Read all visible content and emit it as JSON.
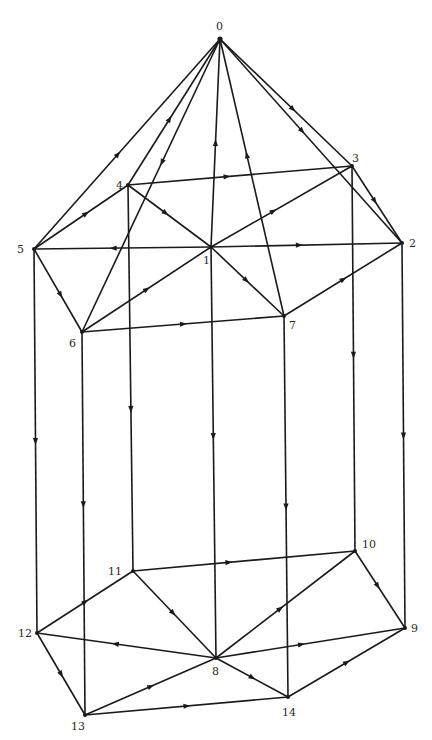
{
  "diagram": {
    "title": "",
    "type": "directed-graph",
    "vertices": [
      {
        "id": "0",
        "x": 220,
        "y": 39,
        "lx": 216,
        "ly": 30
      },
      {
        "id": "1",
        "x": 211,
        "y": 247,
        "lx": 203,
        "ly": 264
      },
      {
        "id": "2",
        "x": 402,
        "y": 243,
        "lx": 409,
        "ly": 247
      },
      {
        "id": "3",
        "x": 352,
        "y": 166,
        "lx": 352,
        "ly": 162
      },
      {
        "id": "4",
        "x": 128,
        "y": 185,
        "lx": 116,
        "ly": 189
      },
      {
        "id": "5",
        "x": 34,
        "y": 249,
        "lx": 17,
        "ly": 253
      },
      {
        "id": "6",
        "x": 82,
        "y": 332,
        "lx": 69,
        "ly": 347
      },
      {
        "id": "7",
        "x": 284,
        "y": 316,
        "lx": 289,
        "ly": 329
      },
      {
        "id": "8",
        "x": 216,
        "y": 658,
        "lx": 212,
        "ly": 675
      },
      {
        "id": "9",
        "x": 405,
        "y": 628,
        "lx": 411,
        "ly": 632
      },
      {
        "id": "10",
        "x": 355,
        "y": 551,
        "lx": 362,
        "ly": 548
      },
      {
        "id": "11",
        "x": 133,
        "y": 571,
        "lx": 108,
        "ly": 575
      },
      {
        "id": "12",
        "x": 37,
        "y": 633,
        "lx": 18,
        "ly": 637
      },
      {
        "id": "13",
        "x": 85,
        "y": 715,
        "lx": 71,
        "ly": 730
      },
      {
        "id": "14",
        "x": 288,
        "y": 697,
        "lx": 282,
        "ly": 716
      }
    ],
    "edges": [
      {
        "from": "5",
        "to": "0",
        "t": 0.45
      },
      {
        "from": "4",
        "to": "0",
        "t": 0.45
      },
      {
        "from": "0",
        "to": "6",
        "t": 0.42
      },
      {
        "from": "1",
        "to": "0",
        "t": 0.5
      },
      {
        "from": "7",
        "to": "0",
        "t": 0.58
      },
      {
        "from": "0",
        "to": "3",
        "t": 0.55
      },
      {
        "from": "0",
        "to": "2",
        "t": 0.45
      },
      {
        "from": "3",
        "to": "2",
        "t": 0.45
      },
      {
        "from": "4",
        "to": "3",
        "t": 0.44
      },
      {
        "from": "5",
        "to": "4",
        "t": 0.55
      },
      {
        "from": "1",
        "to": "5",
        "t": 0.55
      },
      {
        "from": "1",
        "to": "2",
        "t": 0.46
      },
      {
        "from": "4",
        "to": "1",
        "t": 0.45
      },
      {
        "from": "1",
        "to": "3",
        "t": 0.44
      },
      {
        "from": "1",
        "to": "7",
        "t": 0.48
      },
      {
        "from": "6",
        "to": "1",
        "t": 0.5
      },
      {
        "from": "5",
        "to": "6",
        "t": 0.55
      },
      {
        "from": "6",
        "to": "7",
        "t": 0.5
      },
      {
        "from": "7",
        "to": "2",
        "t": 0.5
      },
      {
        "from": "5",
        "to": "12",
        "t": 0.5
      },
      {
        "from": "6",
        "to": "13",
        "t": 0.45
      },
      {
        "from": "4",
        "to": "11",
        "t": 0.58
      },
      {
        "from": "1",
        "to": "8",
        "t": 0.46
      },
      {
        "from": "7",
        "to": "14",
        "t": 0.5
      },
      {
        "from": "3",
        "to": "10",
        "t": 0.49
      },
      {
        "from": "2",
        "to": "9",
        "t": 0.5
      },
      {
        "from": "11",
        "to": "10",
        "t": 0.43
      },
      {
        "from": "11",
        "to": "8",
        "t": 0.48
      },
      {
        "from": "12",
        "to": "11",
        "t": 0.5
      },
      {
        "from": "8",
        "to": "12",
        "t": 0.56
      },
      {
        "from": "8",
        "to": "9",
        "t": 0.45
      },
      {
        "from": "8",
        "to": "10",
        "t": 0.46
      },
      {
        "from": "10",
        "to": "9",
        "t": 0.45
      },
      {
        "from": "12",
        "to": "13",
        "t": 0.5
      },
      {
        "from": "13",
        "to": "8",
        "t": 0.5
      },
      {
        "from": "13",
        "to": "14",
        "t": 0.5
      },
      {
        "from": "8",
        "to": "14",
        "t": 0.5
      },
      {
        "from": "14",
        "to": "9",
        "t": 0.5
      }
    ]
  }
}
